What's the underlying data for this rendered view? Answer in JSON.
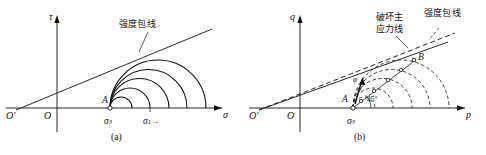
{
  "figure": {
    "width": 486,
    "height": 155,
    "background": "#ffffff",
    "ink": "#111111"
  },
  "panels": [
    {
      "id": "a",
      "caption": "(a)",
      "axes": {
        "y_label": "τ",
        "x_label": "σ",
        "origin_label": "O",
        "origin_prime_label": "O'"
      },
      "annotations": {
        "envelope_label": "强度包线",
        "point_a": "A",
        "sigma3": "σ",
        "sigma3_sub": "3",
        "sigma1": "σ",
        "sigma1_sub": "1",
        "sigma1_arrow": "→"
      },
      "circle_count": 5,
      "circle_style": "solid",
      "description": "Five nested Mohr stress circles sharing left intercept at sigma-3 (point A), tangent to a straight strength envelope rising from O'."
    },
    {
      "id": "b",
      "caption": "(b)",
      "axes": {
        "y_label": "q",
        "x_label": "p",
        "origin_label": "O",
        "origin_prime_label": "O'"
      },
      "annotations": {
        "failure_line_label_line1": "破坏主",
        "failure_line_label_line2": "应力线",
        "envelope_label": "强度包线",
        "point_a": "A",
        "point_b": "B",
        "angle_45": "45°",
        "angle_phi": "φ",
        "sigma3": "σ",
        "sigma3_sub": "3"
      },
      "circle_count": 5,
      "circle_style": "dashed",
      "description": "Five dashed Mohr circles from sigma-3 (point A); solid failure principal stress line through circle apex points at 45 degrees, with dashed strength envelope above it."
    }
  ]
}
